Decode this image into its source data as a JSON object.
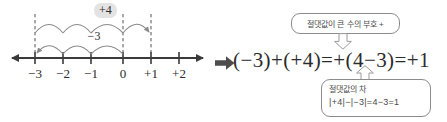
{
  "numberline": {
    "ticks": [
      {
        "value": -3,
        "label": "−3"
      },
      {
        "value": -2,
        "label": "−2"
      },
      {
        "value": -1,
        "label": "−1"
      },
      {
        "value": 0,
        "label": "0"
      },
      {
        "value": 1,
        "label": "+1"
      },
      {
        "value": 2,
        "label": "+2"
      }
    ],
    "dashed_guides": [
      -3,
      0,
      1
    ],
    "upper_hops": {
      "label": "+4",
      "from": -3,
      "to": 1,
      "count": 4,
      "shaded": true
    },
    "lower_hops": {
      "label": "−3",
      "from": 0,
      "to": -3,
      "count": 3,
      "shaded": false
    },
    "left_arrow": true,
    "right_arrow": true
  },
  "implication_arrow": "⇒",
  "equation": "(−3)+(+4)=+(4−3)=+1",
  "callouts": {
    "top": {
      "text": "절댓값이 큰 수의 부호 +",
      "connector": "arrow-down"
    },
    "bottom": {
      "text": "절댓값의 차",
      "formula": "|+4|−|−3|=4−3=1",
      "connector": "arrow-up"
    }
  },
  "colors": {
    "ink": "#2b2b2b",
    "line": "#3a3a3a",
    "arc": "#8a8a8a",
    "dash": "#555555",
    "callout_border": "#8c8c8c",
    "shade": "#e3e3e3",
    "connector_stroke": "#9a9a9a"
  }
}
